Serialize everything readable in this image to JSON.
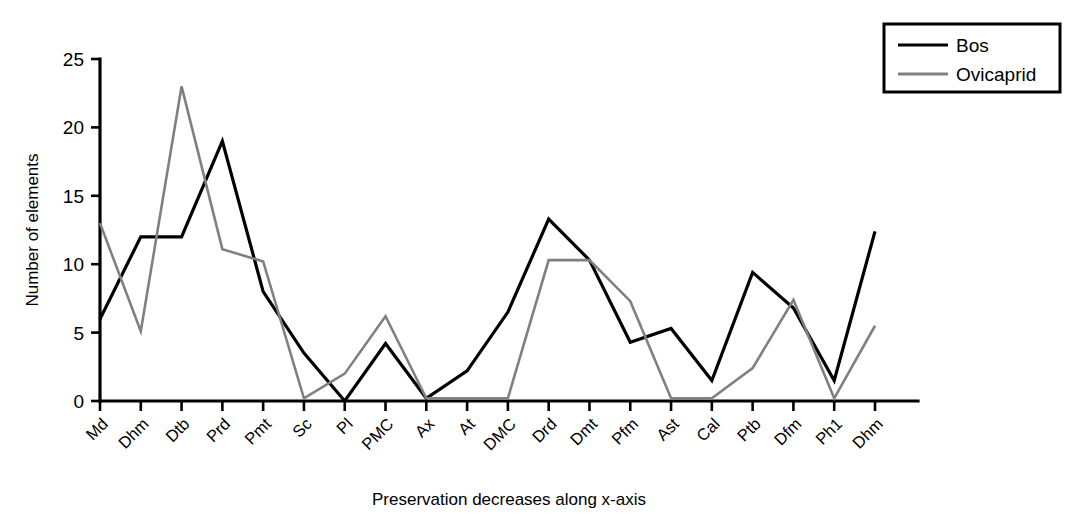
{
  "chart_data": {
    "type": "line",
    "title": "",
    "xlabel": "Preservation decreases along x-axis",
    "ylabel": "Number of elements",
    "ylim": [
      0,
      25
    ],
    "yticks": [
      0,
      5,
      10,
      15,
      20,
      25
    ],
    "grid": false,
    "legend_position": "top-right",
    "categories": [
      "Md",
      "Dhm",
      "Dtb",
      "Prd",
      "Pmt",
      "Sc",
      "Pl",
      "PMC",
      "Ax",
      "At",
      "DMC",
      "Drd",
      "Dmt",
      "Pfm",
      "Ast",
      "Cal",
      "Ptb",
      "Dfm",
      "Ph1",
      "Dhm"
    ],
    "series": [
      {
        "name": "Bos",
        "color": "#000000",
        "values": [
          6,
          12,
          12,
          19,
          8,
          3.5,
          0,
          4.2,
          0.2,
          2.2,
          6.5,
          13.3,
          10.3,
          4.3,
          5.3,
          1.5,
          9.4,
          6.8,
          1.5,
          12.4
        ]
      },
      {
        "name": "Ovicaprid",
        "color": "#808080",
        "values": [
          13,
          5.1,
          23,
          11.1,
          10.2,
          0.2,
          2,
          6.2,
          0.2,
          0.2,
          0.2,
          10.3,
          10.3,
          7.3,
          0.2,
          0.2,
          2.4,
          7.4,
          0.2,
          5.5
        ]
      }
    ]
  },
  "legend": {
    "items": [
      {
        "label": "Bos",
        "color": "#000000"
      },
      {
        "label": "Ovicaprid",
        "color": "#808080"
      }
    ]
  }
}
